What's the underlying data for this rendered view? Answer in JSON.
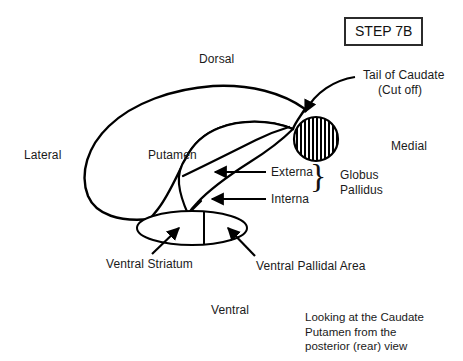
{
  "figure": {
    "step_badge": "STEP 7B",
    "orientation": {
      "dorsal": "Dorsal",
      "ventral": "Ventral",
      "lateral": "Lateral",
      "medial": "Medial"
    },
    "structures": {
      "putamen": "Putamen",
      "tail_of_caudate_line1": "Tail of Caudate",
      "tail_of_caudate_line2": "(Cut off)",
      "externa": "Externa",
      "interna": "Interna",
      "globus_line1": "Globus",
      "globus_line2": "Pallidus",
      "ventral_striatum": "Ventral Striatum",
      "ventral_pallidal_area": "Ventral Pallidal Area"
    },
    "caption": {
      "line1": "Looking at the Caudate",
      "line2": "Putamen from the",
      "line3": "posterior (rear) view"
    },
    "brace_glyph": "}",
    "colors": {
      "ink": "#000000",
      "text": "#1a1a1a",
      "background": "#ffffff",
      "hatch": "#000000"
    }
  }
}
